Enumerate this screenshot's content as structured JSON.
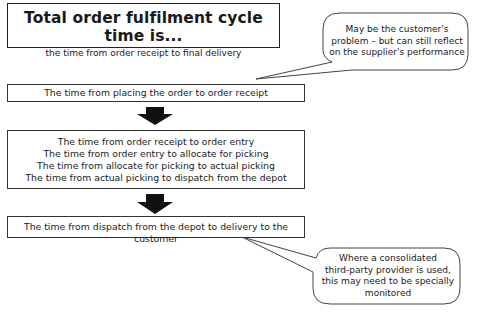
{
  "title_box": {
    "title": "Total order fulfilment cycle time is...",
    "subtitle": "the time from order receipt to final delivery"
  },
  "steps": [
    {
      "lines": [
        "The time from placing the order to order receipt"
      ]
    },
    {
      "lines": [
        "The time from order receipt to order entry",
        "The time from order entry to allocate for picking",
        "The time from allocate for picking to actual picking",
        "The time from actual picking to dispatch from the depot"
      ]
    },
    {
      "lines": [
        "The time from dispatch from the depot to delivery to the customer"
      ]
    }
  ],
  "callouts": [
    {
      "lines": [
        "May be the customer's",
        "problem – but can still reflect",
        "on the supplier's performance"
      ]
    },
    {
      "lines": [
        "Where a consolidated",
        "third-party provider is used,",
        "this may need to be specially",
        "monitored"
      ]
    }
  ],
  "arrows": [
    {
      "icon": "down-arrow-icon"
    },
    {
      "icon": "down-arrow-icon"
    }
  ],
  "colors": {
    "stroke": "#333333",
    "arrow": "#111111",
    "background": "#ffffff"
  }
}
